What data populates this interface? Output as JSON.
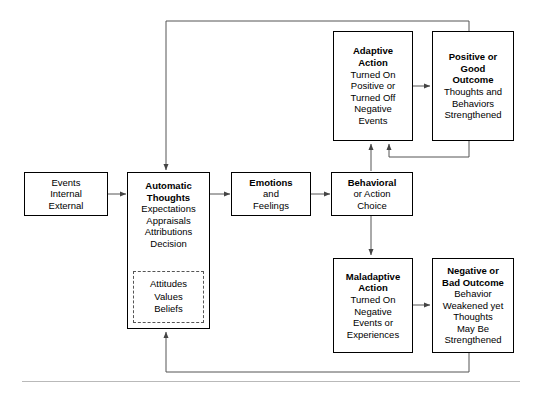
{
  "diagram": {
    "line_color": "#555555",
    "box_border_color": "#000000",
    "background": "#ffffff",
    "rule_color": "#b9b9b9"
  },
  "nodes": {
    "events": {
      "name": "events",
      "lines": [
        "Events",
        "Internal",
        "External"
      ],
      "bold_lines": 0
    },
    "automatic_thoughts": {
      "name": "automatic-thoughts",
      "lines": [
        "Automatic",
        "Thoughts",
        "Expectations",
        "Appraisals",
        "Attributions",
        "Decision"
      ],
      "bold_lines": 2
    },
    "attitudes": {
      "name": "attitudes-values-beliefs",
      "lines": [
        "Attitudes",
        "Values",
        "Beliefs"
      ],
      "bold_lines": 0
    },
    "emotions": {
      "name": "emotions",
      "lines": [
        "Emotions",
        "and",
        "Feelings"
      ],
      "bold_lines": 1
    },
    "behavioral": {
      "name": "behavioral-action-choice",
      "lines": [
        "Behavioral",
        "or Action",
        "Choice"
      ],
      "bold_lines": 1
    },
    "adaptive": {
      "name": "adaptive-action",
      "lines": [
        "Adaptive",
        "Action",
        "Turned On",
        "Positive or",
        "Turned Off",
        "Negative",
        "Events"
      ],
      "bold_lines": 2
    },
    "positive": {
      "name": "positive-good-outcome",
      "lines": [
        "Positive or",
        "Good",
        "Outcome",
        "Thoughts and",
        "Behaviors",
        "Strengthened"
      ],
      "bold_lines": 3
    },
    "maladaptive": {
      "name": "maladaptive-action",
      "lines": [
        "Maladaptive",
        "Action",
        "Turned On",
        "Negative",
        "Events or",
        "Experiences"
      ],
      "bold_lines": 2
    },
    "negative": {
      "name": "negative-bad-outcome",
      "lines": [
        "Negative or",
        "Bad Outcome",
        "Behavior",
        "Weakened yet",
        "Thoughts",
        "May Be",
        "Strengthened"
      ],
      "bold_lines": 2
    }
  },
  "connections": [
    {
      "name": "events-to-automatic-thoughts",
      "from": "events",
      "to": "automatic_thoughts"
    },
    {
      "name": "automatic-thoughts-to-emotions",
      "from": "automatic_thoughts",
      "to": "emotions"
    },
    {
      "name": "emotions-to-behavioral",
      "from": "emotions",
      "to": "behavioral"
    },
    {
      "name": "behavioral-to-adaptive-action",
      "from": "behavioral",
      "to": "adaptive"
    },
    {
      "name": "behavioral-to-maladaptive-action",
      "from": "behavioral",
      "to": "maladaptive"
    },
    {
      "name": "adaptive-to-positive-outcome",
      "from": "adaptive",
      "to": "positive"
    },
    {
      "name": "maladaptive-to-negative-outcome",
      "from": "maladaptive",
      "to": "negative"
    },
    {
      "name": "positive-outcome-to-adaptive-action-loop",
      "from": "positive",
      "to": "adaptive"
    },
    {
      "name": "positive-outcome-to-automatic-thoughts-feedback",
      "from": "positive",
      "to": "automatic_thoughts"
    },
    {
      "name": "negative-outcome-to-automatic-thoughts-feedback",
      "from": "negative",
      "to": "automatic_thoughts"
    }
  ]
}
